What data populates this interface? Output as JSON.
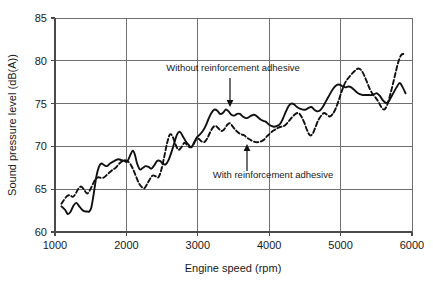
{
  "chart_data": {
    "type": "line",
    "title": "",
    "subtitle": "",
    "xlabel": "Engine speed (rpm)",
    "ylabel": "Sound pressure level (dB(A))",
    "xlim": [
      1000,
      6000
    ],
    "ylim": [
      60,
      85
    ],
    "xticks": [
      1000,
      2000,
      3000,
      4000,
      5000,
      6000
    ],
    "yticks": [
      60,
      65,
      70,
      75,
      80,
      85
    ],
    "xtick_labels": [
      "1000",
      "2000",
      "3000",
      "4000",
      "5000",
      "6000"
    ],
    "ytick_labels": [
      "60",
      "65",
      "70",
      "75",
      "80",
      "85"
    ],
    "grid": true,
    "legend_position": "inline-annotations",
    "series": [
      {
        "name": "Without reinforcement adhesive",
        "style": "solid",
        "color": "#111111",
        "x": [
          1090,
          1140,
          1180,
          1220,
          1260,
          1300,
          1340,
          1380,
          1420,
          1450,
          1480,
          1510,
          1545,
          1580,
          1615,
          1650,
          1690,
          1730,
          1770,
          1810,
          1850,
          1890,
          1930,
          1970,
          2010,
          2050,
          2090,
          2120,
          2150,
          2190,
          2230,
          2270,
          2310,
          2350,
          2390,
          2430,
          2470,
          2510,
          2550,
          2590,
          2630,
          2670,
          2710,
          2750,
          2790,
          2830,
          2870,
          2910,
          2950,
          2990,
          3030,
          3070,
          3110,
          3150,
          3190,
          3230,
          3270,
          3310,
          3350,
          3390,
          3430,
          3470,
          3510,
          3550,
          3590,
          3630,
          3670,
          3710,
          3750,
          3790,
          3830,
          3870,
          3910,
          3950,
          3990,
          4030,
          4070,
          4110,
          4150,
          4190,
          4230,
          4270,
          4310,
          4350,
          4390,
          4430,
          4470,
          4510,
          4550,
          4590,
          4630,
          4670,
          4710,
          4750,
          4790,
          4830,
          4870,
          4910,
          4950,
          4990,
          5030,
          5070,
          5110,
          5150,
          5190,
          5230,
          5270,
          5310,
          5350,
          5390,
          5430,
          5470,
          5510,
          5550,
          5590,
          5630,
          5670,
          5710,
          5750,
          5790,
          5830,
          5870,
          5910
        ],
        "y": [
          63.0,
          62.6,
          62.1,
          62.4,
          63.1,
          63.4,
          63.0,
          62.6,
          62.4,
          62.4,
          62.4,
          62.9,
          64.6,
          66.5,
          67.6,
          68.0,
          67.8,
          67.7,
          68.0,
          68.2,
          68.4,
          68.5,
          68.4,
          68.3,
          68.2,
          68.9,
          69.5,
          69.0,
          68.0,
          67.3,
          67.5,
          67.7,
          67.6,
          67.4,
          67.8,
          68.3,
          68.3,
          68.0,
          67.9,
          68.4,
          69.3,
          70.4,
          71.4,
          71.7,
          71.2,
          70.6,
          70.2,
          69.9,
          70.5,
          71.1,
          71.4,
          71.8,
          72.4,
          73.2,
          73.9,
          74.3,
          74.2,
          73.8,
          73.9,
          74.3,
          74.1,
          73.7,
          73.6,
          73.8,
          73.8,
          73.5,
          73.3,
          73.4,
          73.6,
          73.7,
          73.5,
          73.2,
          73.0,
          72.9,
          72.6,
          72.4,
          72.3,
          72.4,
          72.6,
          73.2,
          74.0,
          74.7,
          75.0,
          74.9,
          74.6,
          74.4,
          74.3,
          74.3,
          74.5,
          74.6,
          74.3,
          74.1,
          74.2,
          74.6,
          75.2,
          75.8,
          76.4,
          76.9,
          77.2,
          77.2,
          77.0,
          76.9,
          77.0,
          76.9,
          76.6,
          76.3,
          76.1,
          76.0,
          76.0,
          76.0,
          76.0,
          76.1,
          76.2,
          75.9,
          75.4,
          75.1,
          75.2,
          75.8,
          76.4,
          77.0,
          77.4,
          76.9,
          76.2
        ]
      },
      {
        "name": "With reinforcement adhesive",
        "style": "dashed",
        "color": "#111111",
        "x": [
          1090,
          1130,
          1170,
          1210,
          1250,
          1290,
          1330,
          1370,
          1410,
          1450,
          1490,
          1530,
          1570,
          1610,
          1650,
          1690,
          1730,
          1770,
          1810,
          1850,
          1890,
          1930,
          1970,
          2010,
          2050,
          2090,
          2130,
          2170,
          2210,
          2250,
          2290,
          2330,
          2370,
          2410,
          2450,
          2490,
          2530,
          2570,
          2610,
          2650,
          2690,
          2730,
          2770,
          2810,
          2850,
          2890,
          2930,
          2970,
          3010,
          3050,
          3090,
          3130,
          3170,
          3210,
          3250,
          3290,
          3330,
          3370,
          3410,
          3450,
          3490,
          3530,
          3570,
          3610,
          3650,
          3690,
          3730,
          3770,
          3810,
          3850,
          3890,
          3930,
          3970,
          4010,
          4050,
          4090,
          4130,
          4170,
          4210,
          4250,
          4290,
          4330,
          4370,
          4410,
          4450,
          4490,
          4530,
          4570,
          4610,
          4650,
          4690,
          4730,
          4770,
          4810,
          4850,
          4890,
          4930,
          4970,
          5010,
          5050,
          5090,
          5130,
          5170,
          5210,
          5250,
          5290,
          5330,
          5370,
          5410,
          5450,
          5490,
          5530,
          5570,
          5610,
          5650,
          5690,
          5730,
          5770,
          5810,
          5850,
          5890
        ],
        "y": [
          63.3,
          63.8,
          64.2,
          64.3,
          64.1,
          64.5,
          65.1,
          65.3,
          64.9,
          64.5,
          64.9,
          65.6,
          66.2,
          66.4,
          66.3,
          66.4,
          66.7,
          67.0,
          67.3,
          67.5,
          67.9,
          68.2,
          68.4,
          68.3,
          68.0,
          67.4,
          66.6,
          65.8,
          65.3,
          65.1,
          65.6,
          66.2,
          66.6,
          66.5,
          66.4,
          67.3,
          68.8,
          70.4,
          71.4,
          71.1,
          70.2,
          69.6,
          69.9,
          70.4,
          70.2,
          69.9,
          70.1,
          70.7,
          70.9,
          70.6,
          70.5,
          70.9,
          71.6,
          72.2,
          72.4,
          72.1,
          71.8,
          72.0,
          72.5,
          72.7,
          72.3,
          71.9,
          71.6,
          71.4,
          71.3,
          71.0,
          70.8,
          70.6,
          70.5,
          70.5,
          70.6,
          70.8,
          71.2,
          71.5,
          71.8,
          72.0,
          72.2,
          72.3,
          72.4,
          72.7,
          73.1,
          73.5,
          73.8,
          73.9,
          73.5,
          72.8,
          71.9,
          71.3,
          71.5,
          72.3,
          73.1,
          73.6,
          73.9,
          73.7,
          73.5,
          73.8,
          74.4,
          75.3,
          76.3,
          77.2,
          77.8,
          78.2,
          78.6,
          78.9,
          79.1,
          78.9,
          78.3,
          77.5,
          76.7,
          76.1,
          75.7,
          75.2,
          74.6,
          74.3,
          74.8,
          75.9,
          77.2,
          78.6,
          79.9,
          80.7,
          80.8
        ]
      }
    ],
    "annotations": [
      {
        "text": "Without reinforcement adhesive",
        "target_series": "Without reinforcement adhesive",
        "target_x": 3600,
        "target_y": 73.7,
        "direction": "down"
      },
      {
        "text": "With reinforcement adhesive",
        "target_series": "With reinforcement adhesive",
        "target_x": 3830,
        "target_y": 70.6,
        "direction": "up"
      }
    ]
  }
}
